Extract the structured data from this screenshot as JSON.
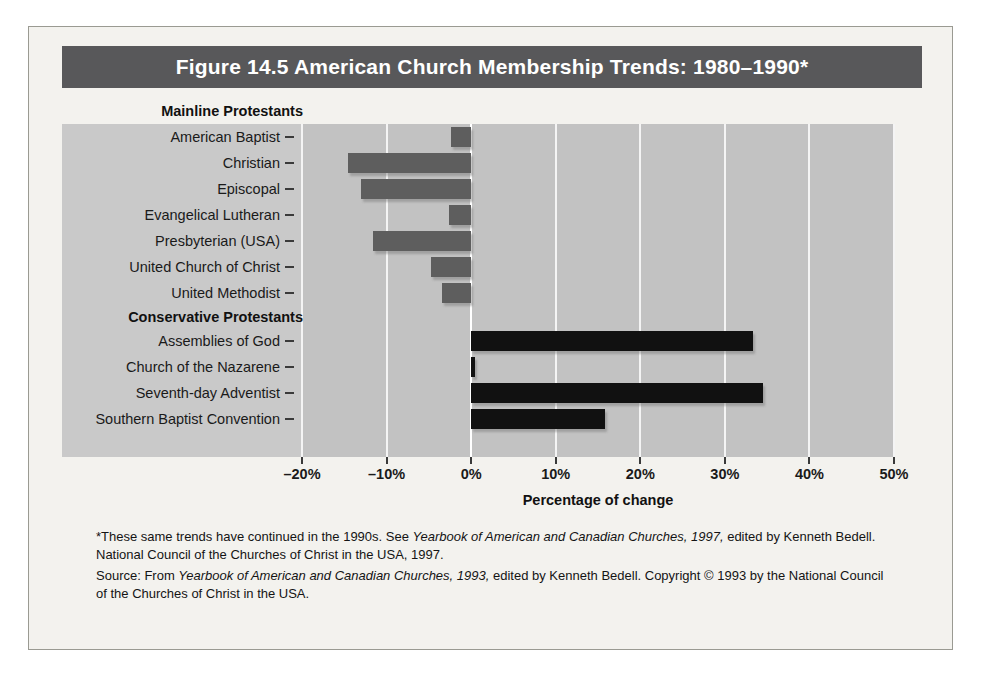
{
  "figure": {
    "title": "Figure 14.5  American Church Membership Trends: 1980–1990*",
    "axis_title": "Percentage of change"
  },
  "groups": [
    {
      "heading": "Mainline Protestants"
    },
    {
      "heading": "Conservative Protestants"
    }
  ],
  "notes": {
    "footnote_line1_a": "*These same trends have continued in the 1990s. See ",
    "footnote_line1_italic": "Yearbook of American and Canadian Churches, 1997,",
    "footnote_line1_b": " edited by Kenneth Bedell. National Council of the Churches of Christ in the USA, 1997.",
    "source_a": "Source: From ",
    "source_italic": "Yearbook of American and Canadian Churches, 1993,",
    "source_b": " edited by Kenneth Bedell. Copyright © 1993 by the National Council of the Churches of Christ in the USA."
  },
  "colors": {
    "banner": "#58585a",
    "plot_bg": "#c2c2c2",
    "label_band": "#c9c9c9",
    "page_bg": "#f3f2ee",
    "negative_bar": "#5e5e5e",
    "positive_bar": "#111111",
    "gridline": "#f4f4f4"
  },
  "chart_data": {
    "type": "bar",
    "orientation": "horizontal",
    "title": "Figure 14.5  American Church Membership Trends: 1980–1990*",
    "xlabel": "Percentage of change",
    "ylabel": "",
    "xlim": [
      -20,
      50
    ],
    "xticks": [
      -20,
      -10,
      0,
      10,
      20,
      30,
      40,
      50
    ],
    "xticklabels": [
      "–20%",
      "–10%",
      "0%",
      "10%",
      "20%",
      "30%",
      "40%",
      "50%"
    ],
    "grid": true,
    "legend": false,
    "categories": [
      "American Baptist",
      "Christian",
      "Episcopal",
      "Evangelical Lutheran",
      "Presbyterian (USA)",
      "United Church of Christ",
      "United Methodist",
      "Assemblies of God",
      "Church of the Nazarene",
      "Seventh-day Adventist",
      "Southern Baptist Convention"
    ],
    "values": [
      -2.4,
      -14.6,
      -13.0,
      -2.6,
      -11.6,
      -4.8,
      -3.4,
      33.3,
      0.4,
      34.5,
      15.8
    ],
    "group_of": [
      "Mainline Protestants",
      "Mainline Protestants",
      "Mainline Protestants",
      "Mainline Protestants",
      "Mainline Protestants",
      "Mainline Protestants",
      "Mainline Protestants",
      "Conservative Protestants",
      "Conservative Protestants",
      "Conservative Protestants",
      "Conservative Protestants"
    ]
  }
}
